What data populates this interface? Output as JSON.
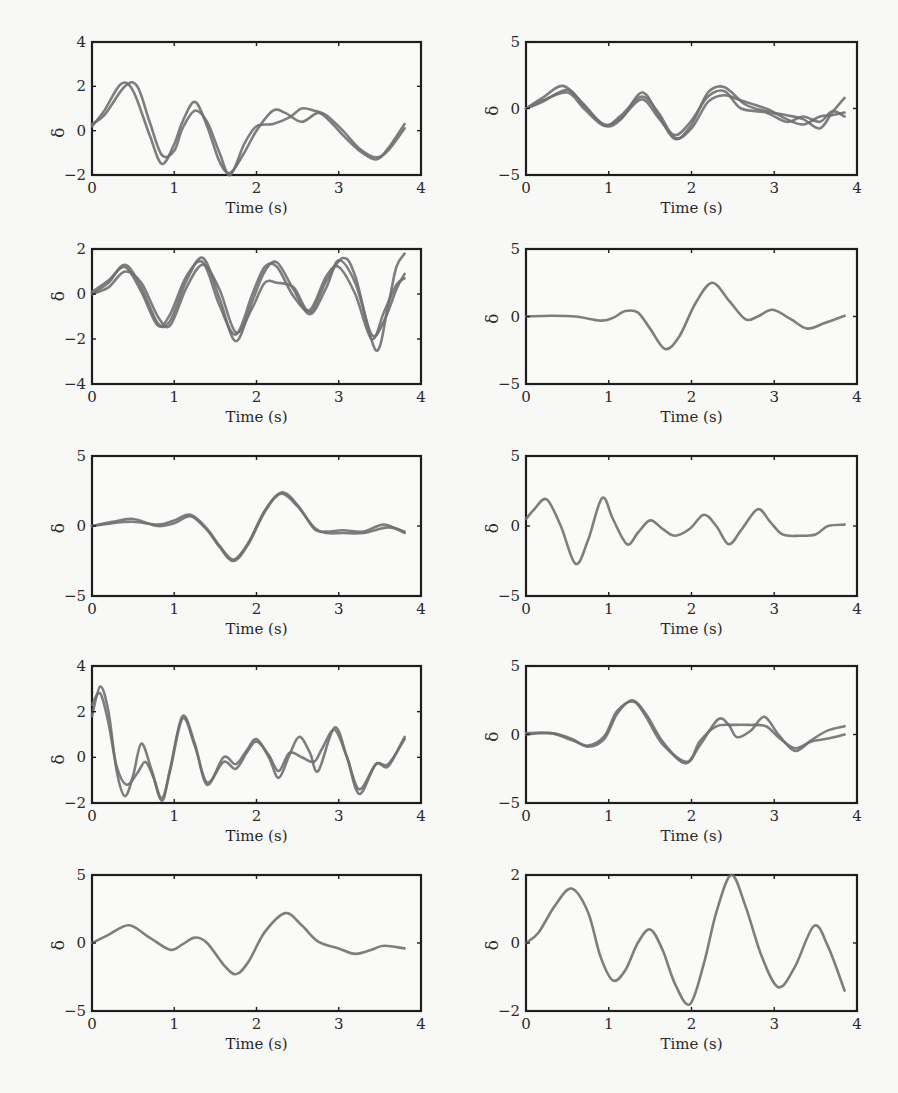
{
  "figure": {
    "panel_count": 10,
    "layout": "5 rows x 2 columns",
    "line_color": "#707070",
    "frame_color": "#1e1e1e"
  },
  "chart_data": [
    {
      "type": "line",
      "panel": "row1-left",
      "title": "",
      "xlabel": "Time (s)",
      "ylabel": "δ",
      "xlim": [
        0,
        4
      ],
      "ylim": [
        -2,
        4
      ],
      "xticks": [
        "0",
        "1",
        "2",
        "3",
        "4"
      ],
      "yticks": [
        "-2",
        "0",
        "2",
        "4"
      ],
      "series": [
        {
          "name": "trace-1",
          "x": [
            0,
            0.15,
            0.35,
            0.5,
            0.7,
            0.85,
            1.0,
            1.1,
            1.25,
            1.4,
            1.55,
            1.68,
            1.85,
            2.0,
            2.2,
            2.35,
            2.55,
            2.75,
            2.9,
            3.05,
            3.25,
            3.45,
            3.6,
            3.8
          ],
          "y": [
            0.2,
            0.9,
            2.1,
            1.8,
            -0.2,
            -1.5,
            -0.6,
            0.4,
            1.3,
            0.2,
            -1.4,
            -1.9,
            -1.0,
            0.0,
            0.9,
            0.8,
            0.4,
            0.8,
            0.4,
            -0.2,
            -0.9,
            -1.3,
            -0.8,
            0.3
          ]
        },
        {
          "name": "trace-2",
          "x": [
            0,
            0.15,
            0.4,
            0.55,
            0.7,
            0.85,
            1.0,
            1.1,
            1.25,
            1.4,
            1.55,
            1.68,
            1.85,
            2.0,
            2.2,
            2.4,
            2.55,
            2.7,
            2.85,
            3.05,
            3.25,
            3.45,
            3.6,
            3.8
          ],
          "y": [
            0.3,
            0.7,
            2.0,
            2.0,
            0.4,
            -1.1,
            -0.9,
            0.1,
            0.9,
            0.4,
            -1.0,
            -2.0,
            -0.6,
            0.2,
            0.3,
            0.6,
            1.0,
            0.9,
            0.7,
            0.0,
            -0.8,
            -1.2,
            -0.9,
            0.1
          ]
        }
      ]
    },
    {
      "type": "line",
      "panel": "row1-right",
      "title": "",
      "xlabel": "Time (s)",
      "ylabel": "δ",
      "xlim": [
        0,
        4
      ],
      "ylim": [
        -5,
        5
      ],
      "xticks": [
        "0",
        "1",
        "2",
        "3",
        "4"
      ],
      "yticks": [
        "-5",
        "0",
        "5"
      ],
      "series": [
        {
          "name": "trace-1",
          "x": [
            0,
            0.2,
            0.45,
            0.7,
            0.95,
            1.15,
            1.4,
            1.6,
            1.8,
            2.0,
            2.2,
            2.4,
            2.65,
            2.9,
            3.15,
            3.35,
            3.55,
            3.7,
            3.85
          ],
          "y": [
            0,
            0.8,
            1.7,
            0.3,
            -1.3,
            -0.8,
            1.2,
            -0.5,
            -2.3,
            -1.2,
            1.2,
            1.6,
            0.3,
            -0.2,
            -0.5,
            -0.8,
            -1.5,
            -0.3,
            0.8
          ]
        },
        {
          "name": "trace-2",
          "x": [
            0,
            0.2,
            0.5,
            0.7,
            0.95,
            1.15,
            1.4,
            1.6,
            1.8,
            2.0,
            2.2,
            2.4,
            2.6,
            2.9,
            3.15,
            3.35,
            3.55,
            3.7,
            3.85
          ],
          "y": [
            0,
            0.5,
            1.4,
            0.2,
            -1.2,
            -0.7,
            0.7,
            -0.7,
            -2.0,
            -0.9,
            0.9,
            1.3,
            0.0,
            -0.3,
            -1.0,
            -0.6,
            -1.0,
            -0.2,
            -0.6
          ]
        },
        {
          "name": "trace-3",
          "x": [
            0,
            0.2,
            0.5,
            0.7,
            0.95,
            1.15,
            1.4,
            1.6,
            1.8,
            2.0,
            2.2,
            2.4,
            2.6,
            2.9,
            3.15,
            3.35,
            3.55,
            3.7,
            3.85
          ],
          "y": [
            0,
            0.6,
            1.2,
            0.0,
            -1.3,
            -0.5,
            0.9,
            -0.3,
            -2.2,
            -1.5,
            0.5,
            1.0,
            0.6,
            0.0,
            -0.8,
            -1.2,
            -0.6,
            -0.5,
            -0.3
          ]
        }
      ]
    },
    {
      "type": "line",
      "panel": "row2-left",
      "title": "",
      "xlabel": "Time (s)",
      "ylabel": "δ",
      "xlim": [
        0,
        4
      ],
      "ylim": [
        -4,
        2
      ],
      "xticks": [
        "0",
        "1",
        "2",
        "3",
        "4"
      ],
      "yticks": [
        "-4",
        "-2",
        "0",
        "2"
      ],
      "series": [
        {
          "name": "trace-1",
          "x": [
            0,
            0.2,
            0.4,
            0.6,
            0.8,
            0.95,
            1.15,
            1.35,
            1.55,
            1.75,
            1.95,
            2.1,
            2.25,
            2.45,
            2.65,
            2.85,
            3.0,
            3.2,
            3.4,
            3.55,
            3.7,
            3.8
          ],
          "y": [
            0,
            0.5,
            1.3,
            0.3,
            -1.3,
            -1.2,
            0.6,
            1.6,
            -0.2,
            -2.1,
            -0.3,
            1.0,
            1.4,
            0.2,
            -0.9,
            0.3,
            1.5,
            0.5,
            -1.8,
            -1.2,
            0.2,
            0.9
          ]
        },
        {
          "name": "trace-2",
          "x": [
            0,
            0.2,
            0.4,
            0.6,
            0.8,
            0.95,
            1.15,
            1.35,
            1.55,
            1.75,
            1.95,
            2.1,
            2.25,
            2.45,
            2.65,
            2.85,
            3.05,
            3.2,
            3.45,
            3.6,
            3.7,
            3.8
          ],
          "y": [
            0,
            0.3,
            1.0,
            0.5,
            -1.0,
            -1.4,
            0.3,
            1.3,
            0.2,
            -1.7,
            -0.6,
            0.5,
            0.5,
            0.3,
            -0.8,
            0.6,
            1.6,
            0.8,
            -2.5,
            -0.5,
            1.2,
            1.8
          ]
        },
        {
          "name": "trace-3",
          "x": [
            0,
            0.2,
            0.4,
            0.6,
            0.8,
            0.95,
            1.15,
            1.35,
            1.55,
            1.75,
            1.95,
            2.1,
            2.25,
            2.45,
            2.65,
            2.85,
            3.0,
            3.2,
            3.4,
            3.55,
            3.7,
            3.8
          ],
          "y": [
            0.1,
            0.6,
            1.2,
            0.1,
            -1.4,
            -0.9,
            0.8,
            1.4,
            -0.5,
            -1.8,
            0.0,
            1.2,
            1.2,
            -0.1,
            -0.7,
            0.8,
            1.2,
            0.0,
            -2.0,
            -0.8,
            0.4,
            0.7
          ]
        }
      ]
    },
    {
      "type": "line",
      "panel": "row2-right",
      "title": "",
      "xlabel": "Time (s)",
      "ylabel": "δ",
      "xlim": [
        0,
        4
      ],
      "ylim": [
        -5,
        5
      ],
      "xticks": [
        "0",
        "1",
        "2",
        "3",
        "4"
      ],
      "yticks": [
        "-5",
        "0",
        "5"
      ],
      "series": [
        {
          "name": "trace-1",
          "x": [
            0,
            0.3,
            0.6,
            0.9,
            1.05,
            1.2,
            1.35,
            1.5,
            1.68,
            1.85,
            2.05,
            2.25,
            2.45,
            2.65,
            2.8,
            2.98,
            3.2,
            3.4,
            3.6,
            3.85
          ],
          "y": [
            0,
            0.05,
            0.0,
            -0.3,
            -0.1,
            0.4,
            0.3,
            -0.9,
            -2.4,
            -1.5,
            1.0,
            2.5,
            1.2,
            -0.2,
            0.0,
            0.5,
            -0.2,
            -0.9,
            -0.5,
            0.05
          ]
        }
      ]
    },
    {
      "type": "line",
      "panel": "row3-left",
      "title": "",
      "xlabel": "Time (s)",
      "ylabel": "δ",
      "xlim": [
        0,
        4
      ],
      "ylim": [
        -5,
        5
      ],
      "xticks": [
        "0",
        "1",
        "2",
        "3",
        "4"
      ],
      "yticks": [
        "-5",
        "0",
        "5"
      ],
      "series": [
        {
          "name": "trace-1",
          "x": [
            0,
            0.25,
            0.5,
            0.8,
            1.0,
            1.2,
            1.4,
            1.55,
            1.72,
            1.9,
            2.1,
            2.3,
            2.5,
            2.7,
            2.85,
            3.05,
            3.3,
            3.55,
            3.8
          ],
          "y": [
            0,
            0.3,
            0.5,
            0.0,
            0.2,
            0.7,
            -0.3,
            -1.5,
            -2.5,
            -1.3,
            1.0,
            2.4,
            1.5,
            -0.2,
            -0.4,
            -0.3,
            -0.4,
            0.1,
            -0.5
          ]
        },
        {
          "name": "trace-2",
          "x": [
            0,
            0.25,
            0.5,
            0.8,
            1.0,
            1.2,
            1.4,
            1.55,
            1.72,
            1.9,
            2.1,
            2.3,
            2.5,
            2.7,
            2.85,
            3.05,
            3.3,
            3.6,
            3.8
          ],
          "y": [
            0,
            0.2,
            0.3,
            0.1,
            0.4,
            0.8,
            -0.2,
            -1.4,
            -2.4,
            -1.2,
            1.1,
            2.3,
            1.4,
            -0.1,
            -0.5,
            -0.5,
            -0.5,
            -0.1,
            -0.4
          ]
        }
      ]
    },
    {
      "type": "line",
      "panel": "row3-right",
      "title": "",
      "xlabel": "Time (s)",
      "ylabel": "δ",
      "xlim": [
        0,
        4
      ],
      "ylim": [
        -5,
        5
      ],
      "xticks": [
        "0",
        "1",
        "2",
        "3",
        "4"
      ],
      "yticks": [
        "-5",
        "0",
        "5"
      ],
      "series": [
        {
          "name": "trace-1",
          "x": [
            0,
            0.1,
            0.25,
            0.42,
            0.6,
            0.75,
            0.92,
            1.05,
            1.22,
            1.35,
            1.5,
            1.65,
            1.8,
            1.98,
            2.15,
            2.3,
            2.45,
            2.6,
            2.8,
            2.95,
            3.1,
            3.3,
            3.5,
            3.65,
            3.85
          ],
          "y": [
            0.5,
            1.2,
            1.9,
            0.0,
            -2.7,
            -1.0,
            2.0,
            0.5,
            -1.3,
            -0.5,
            0.4,
            -0.2,
            -0.7,
            -0.2,
            0.8,
            0.0,
            -1.3,
            -0.3,
            1.2,
            0.3,
            -0.6,
            -0.7,
            -0.6,
            0.0,
            0.1
          ]
        }
      ]
    },
    {
      "type": "line",
      "panel": "row4-left",
      "title": "",
      "xlabel": "Time (s)",
      "ylabel": "δ",
      "xlim": [
        0,
        4
      ],
      "ylim": [
        -2,
        4
      ],
      "xticks": [
        "0",
        "1",
        "2",
        "3",
        "4"
      ],
      "yticks": [
        "-2",
        "0",
        "2",
        "4"
      ],
      "series": [
        {
          "name": "trace-1",
          "x": [
            0,
            0.1,
            0.2,
            0.3,
            0.4,
            0.5,
            0.6,
            0.72,
            0.85,
            0.95,
            1.1,
            1.25,
            1.4,
            1.6,
            1.75,
            1.88,
            2.0,
            2.15,
            2.27,
            2.4,
            2.52,
            2.65,
            2.75,
            2.95,
            3.1,
            3.25,
            3.45,
            3.6,
            3.8
          ],
          "y": [
            1.8,
            3.1,
            2.0,
            -0.6,
            -1.7,
            -0.8,
            0.6,
            -0.5,
            -1.9,
            -0.5,
            1.8,
            0.6,
            -1.2,
            0.0,
            -0.3,
            0.3,
            0.8,
            0.0,
            -0.9,
            0.1,
            0.9,
            0.2,
            -0.6,
            1.3,
            0.0,
            -1.6,
            -0.3,
            -0.4,
            0.9
          ]
        },
        {
          "name": "trace-2",
          "x": [
            0,
            0.1,
            0.2,
            0.3,
            0.42,
            0.55,
            0.65,
            0.75,
            0.85,
            0.95,
            1.1,
            1.25,
            1.4,
            1.6,
            1.75,
            1.88,
            2.0,
            2.15,
            2.27,
            2.4,
            2.55,
            2.7,
            2.8,
            2.95,
            3.1,
            3.25,
            3.45,
            3.6,
            3.8
          ],
          "y": [
            2.3,
            2.8,
            1.5,
            -0.4,
            -1.2,
            -0.7,
            -0.2,
            -0.9,
            -1.8,
            -0.6,
            1.7,
            0.5,
            -1.1,
            -0.2,
            -0.5,
            0.2,
            0.7,
            0.1,
            -0.6,
            0.2,
            0.0,
            -0.2,
            0.4,
            1.2,
            0.0,
            -1.4,
            -0.3,
            -0.3,
            0.8
          ]
        }
      ]
    },
    {
      "type": "line",
      "panel": "row4-right",
      "title": "",
      "xlabel": "Time (s)",
      "ylabel": "δ",
      "xlim": [
        0,
        4
      ],
      "ylim": [
        -5,
        5
      ],
      "xticks": [
        "0",
        "1",
        "2",
        "3",
        "4"
      ],
      "yticks": [
        "-5",
        "0",
        "5"
      ],
      "series": [
        {
          "name": "trace-1",
          "x": [
            0,
            0.3,
            0.55,
            0.75,
            0.95,
            1.1,
            1.28,
            1.45,
            1.65,
            1.92,
            2.1,
            2.32,
            2.45,
            2.55,
            2.72,
            2.88,
            3.05,
            3.25,
            3.45,
            3.65,
            3.85
          ],
          "y": [
            0,
            0.1,
            -0.3,
            -0.9,
            -0.3,
            1.5,
            2.5,
            1.5,
            -0.5,
            -2.1,
            -0.8,
            1.1,
            0.7,
            -0.2,
            0.3,
            1.3,
            0.0,
            -1.2,
            -0.4,
            0.3,
            0.6
          ]
        },
        {
          "name": "trace-2",
          "x": [
            0,
            0.3,
            0.55,
            0.75,
            0.95,
            1.1,
            1.3,
            1.45,
            1.65,
            1.95,
            2.1,
            2.3,
            2.5,
            2.7,
            2.9,
            3.05,
            3.25,
            3.45,
            3.65,
            3.85
          ],
          "y": [
            0.1,
            0.1,
            -0.4,
            -0.8,
            -0.1,
            1.7,
            2.4,
            1.3,
            -0.7,
            -2.0,
            -0.5,
            0.6,
            0.7,
            0.7,
            0.6,
            -0.2,
            -1.0,
            -0.5,
            -0.3,
            0.0
          ]
        }
      ]
    },
    {
      "type": "line",
      "panel": "row5-left",
      "title": "",
      "xlabel": "Time (s)",
      "ylabel": "δ",
      "xlim": [
        0,
        4
      ],
      "ylim": [
        -5,
        5
      ],
      "xticks": [
        "0",
        "1",
        "2",
        "3",
        "4"
      ],
      "yticks": [
        "-5",
        "0",
        "5"
      ],
      "series": [
        {
          "name": "trace-1",
          "x": [
            0,
            0.2,
            0.45,
            0.7,
            0.95,
            1.1,
            1.25,
            1.4,
            1.6,
            1.75,
            1.9,
            2.1,
            2.35,
            2.55,
            2.75,
            3.0,
            3.2,
            3.4,
            3.55,
            3.8
          ],
          "y": [
            0,
            0.6,
            1.3,
            0.4,
            -0.5,
            -0.1,
            0.4,
            0.0,
            -1.6,
            -2.3,
            -1.4,
            0.8,
            2.2,
            1.3,
            0.1,
            -0.4,
            -0.8,
            -0.5,
            -0.2,
            -0.4
          ]
        }
      ]
    },
    {
      "type": "line",
      "panel": "row5-right",
      "title": "",
      "xlabel": "Time (s)",
      "ylabel": "δ",
      "xlim": [
        0,
        4
      ],
      "ylim": [
        -2,
        2
      ],
      "xticks": [
        "0",
        "1",
        "2",
        "3",
        "4"
      ],
      "yticks": [
        "-2",
        "0",
        "2"
      ],
      "series": [
        {
          "name": "trace-1",
          "x": [
            0,
            0.15,
            0.35,
            0.55,
            0.75,
            0.9,
            1.05,
            1.2,
            1.35,
            1.5,
            1.65,
            1.8,
            1.98,
            2.15,
            2.3,
            2.48,
            2.65,
            2.85,
            3.05,
            3.25,
            3.48,
            3.65,
            3.85
          ],
          "y": [
            0,
            0.3,
            1.1,
            1.6,
            0.9,
            -0.4,
            -1.1,
            -0.8,
            0.0,
            0.4,
            -0.2,
            -1.2,
            -1.8,
            -0.6,
            0.9,
            2.0,
            1.1,
            -0.4,
            -1.3,
            -0.7,
            0.5,
            -0.1,
            -1.4
          ]
        }
      ]
    }
  ]
}
